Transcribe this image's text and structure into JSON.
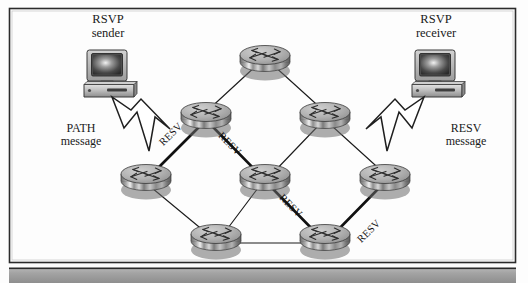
{
  "figure": {
    "kind": "network-diagram",
    "background_color": "#fdfdfd",
    "frame_color": "#2b2b2b",
    "footer_band_color": "#9a9a9a",
    "link_color": "#1c1c1c",
    "highlight_link_color": "#111111"
  },
  "endpoints": {
    "sender": {
      "line1": "RSVP",
      "line2": "sender",
      "icon": "desktop-computer-icon"
    },
    "receiver": {
      "line1": "RSVP",
      "line2": "receiver",
      "icon": "desktop-computer-icon"
    }
  },
  "messages": {
    "path": {
      "line1": "PATH",
      "line2": "message",
      "arrow": "block-arrow-down-right-icon"
    },
    "resv": {
      "line1": "RESV",
      "line2": "message",
      "arrow": "block-arrow-down-left-icon"
    }
  },
  "link_labels": [
    {
      "text": "RESV",
      "edge": "left-to-upper-left"
    },
    {
      "text": "RESV",
      "edge": "upper-left-to-center"
    },
    {
      "text": "RESV",
      "edge": "center-to-bottom-right"
    },
    {
      "text": "RESV",
      "edge": "bottom-right-to-right"
    }
  ],
  "routers": [
    {
      "id": "r-top",
      "name": "router-top",
      "x": 265,
      "y": 62
    },
    {
      "id": "r-upper-left",
      "name": "router-upper-left",
      "x": 206,
      "y": 119
    },
    {
      "id": "r-upper-right",
      "name": "router-upper-right",
      "x": 325,
      "y": 119
    },
    {
      "id": "r-left",
      "name": "router-left",
      "x": 146,
      "y": 181
    },
    {
      "id": "r-center",
      "name": "router-center",
      "x": 265,
      "y": 181
    },
    {
      "id": "r-right",
      "name": "router-right",
      "x": 385,
      "y": 181
    },
    {
      "id": "r-bottom-left",
      "name": "router-bottom-left",
      "x": 216,
      "y": 241
    },
    {
      "id": "r-bottom-right",
      "name": "router-bottom-right",
      "x": 325,
      "y": 241
    }
  ],
  "links": [
    {
      "from": "r-upper-left",
      "to": "r-top",
      "highlighted": false
    },
    {
      "from": "r-top",
      "to": "r-upper-right",
      "highlighted": false
    },
    {
      "from": "r-left",
      "to": "r-upper-left",
      "highlighted": true
    },
    {
      "from": "r-upper-left",
      "to": "r-center",
      "highlighted": true
    },
    {
      "from": "r-upper-right",
      "to": "r-center",
      "highlighted": false
    },
    {
      "from": "r-upper-right",
      "to": "r-right",
      "highlighted": false
    },
    {
      "from": "r-left",
      "to": "r-bottom-left",
      "highlighted": false
    },
    {
      "from": "r-center",
      "to": "r-bottom-left",
      "highlighted": false
    },
    {
      "from": "r-center",
      "to": "r-bottom-right",
      "highlighted": true
    },
    {
      "from": "r-bottom-left",
      "to": "r-bottom-right",
      "highlighted": false
    },
    {
      "from": "r-bottom-right",
      "to": "r-right",
      "highlighted": true
    }
  ]
}
